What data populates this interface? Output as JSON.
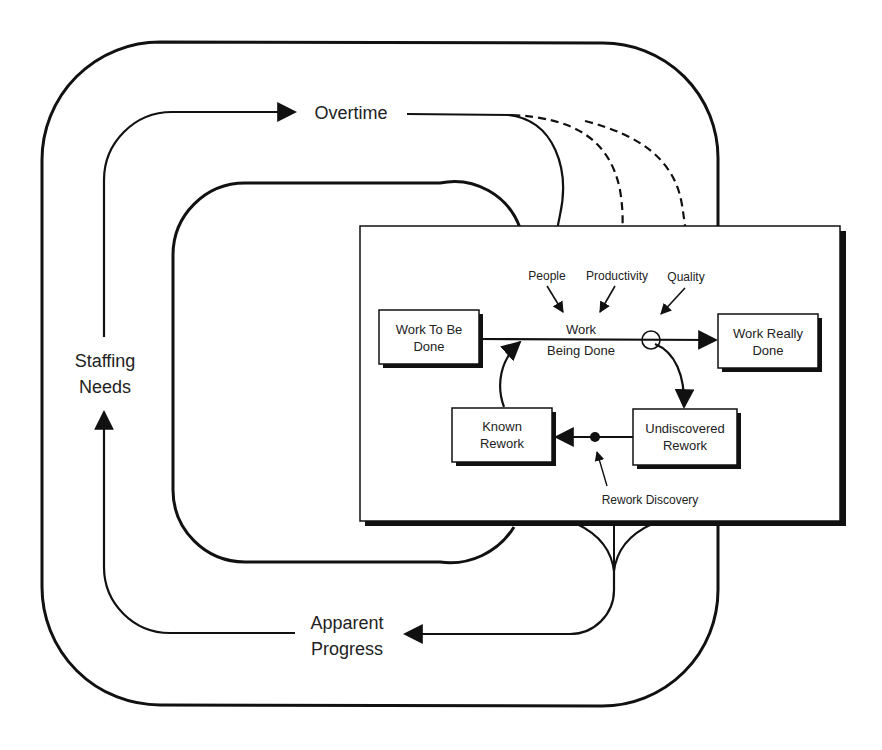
{
  "diagram": {
    "type": "system-dynamics-rework-cycle",
    "colors": {
      "stroke": "#111111",
      "text": "#222222",
      "background": "#ffffff",
      "panel": "#ffffff",
      "shadow": "#111111"
    },
    "outer_loop": {
      "labels": {
        "overtime": "Overtime",
        "staffing_needs_line1": "Staffing",
        "staffing_needs_line2": "Needs",
        "apparent_progress_line1": "Apparent",
        "apparent_progress_line2": "Progress"
      }
    },
    "panel": {
      "influences": {
        "people": "People",
        "productivity": "Productivity",
        "quality": "Quality"
      },
      "flow_label_line1": "Work",
      "flow_label_line2": "Being Done",
      "stocks": {
        "work_to_be_done": {
          "line1": "Work To Be",
          "line2": "Done"
        },
        "work_really_done": {
          "line1": "Work Really",
          "line2": "Done"
        },
        "known_rework": {
          "line1": "Known",
          "line2": "Rework"
        },
        "undiscovered_rework": {
          "line1": "Undiscovered",
          "line2": "Rework"
        }
      },
      "rework_discovery": "Rework Discovery"
    },
    "links": [
      {
        "from": "Staffing Needs",
        "to": "Overtime",
        "style": "solid"
      },
      {
        "from": "Overtime",
        "to": "People",
        "style": "solid"
      },
      {
        "from": "Overtime",
        "to": "Productivity",
        "style": "dashed"
      },
      {
        "from": "Overtime",
        "to": "Quality",
        "style": "dashed"
      },
      {
        "from": "Work Being Done",
        "to": "Apparent Progress",
        "style": "solid"
      },
      {
        "from": "Apparent Progress",
        "to": "Staffing Needs",
        "style": "solid"
      }
    ]
  }
}
